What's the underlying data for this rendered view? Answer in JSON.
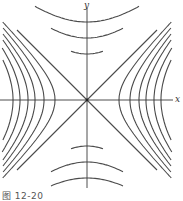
{
  "figure": {
    "caption": "图 12-20",
    "axes": {
      "x_label": "x",
      "y_label": "y"
    },
    "origin_px": [
      87,
      100
    ],
    "asymptotes": [
      "y = x",
      "y = -x"
    ],
    "horizontal_hyperbola_vertex_offsets_px": [
      32,
      43,
      52,
      59,
      67,
      74
    ],
    "vertical_hyperbola_vertex_offsets_px": [
      46,
      62,
      78
    ],
    "colors": {
      "curve": "#4a4a4a",
      "axis": "#3a3a3a",
      "background": "#ffffff"
    }
  }
}
